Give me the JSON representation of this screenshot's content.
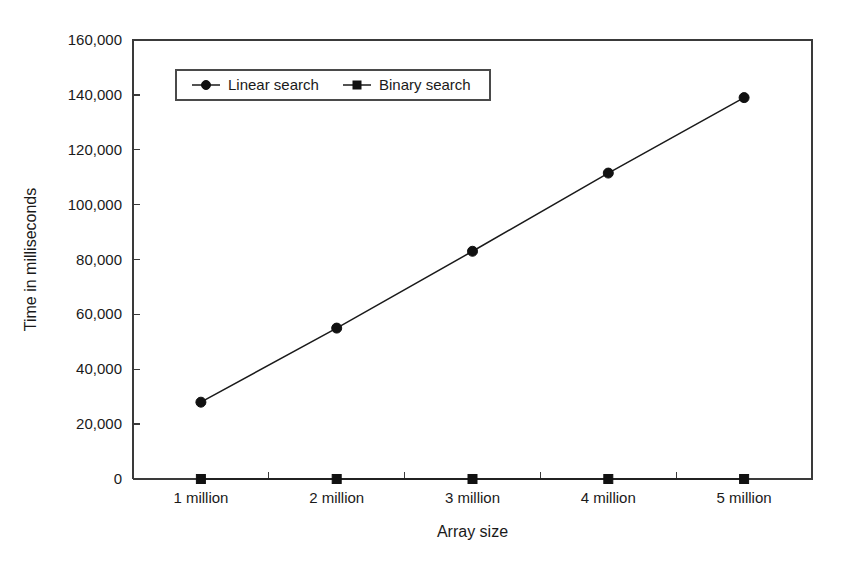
{
  "chart_data": {
    "type": "line",
    "title": "",
    "xlabel": "Array size",
    "ylabel": "Time in milliseconds",
    "categories": [
      "1 million",
      "2 million",
      "3 million",
      "4 million",
      "5 million"
    ],
    "series": [
      {
        "name": "Linear search",
        "marker": "circle",
        "values": [
          28000,
          55000,
          83000,
          111500,
          139000
        ]
      },
      {
        "name": "Binary search",
        "marker": "square",
        "values": [
          1,
          1,
          1,
          1,
          1
        ]
      }
    ],
    "ylim": [
      0,
      160000
    ],
    "ytick_values": [
      0,
      20000,
      40000,
      60000,
      80000,
      100000,
      120000,
      140000,
      160000
    ],
    "ytick_labels": [
      "0",
      "20,000",
      "40,000",
      "60,000",
      "80,000",
      "100,000",
      "120,000",
      "140,000",
      "160,000"
    ],
    "grid": false,
    "legend_position": "top-left-inside",
    "colors": {
      "series_line": "#1a1a1a",
      "axis": "#3a3a3a",
      "background": "#ffffff",
      "text": "#1a1a1a"
    }
  },
  "legend": {
    "entries": [
      {
        "label": "Linear search"
      },
      {
        "label": "Binary search"
      }
    ]
  },
  "axes": {
    "x_title": "Array size",
    "y_title": "Time in milliseconds"
  }
}
